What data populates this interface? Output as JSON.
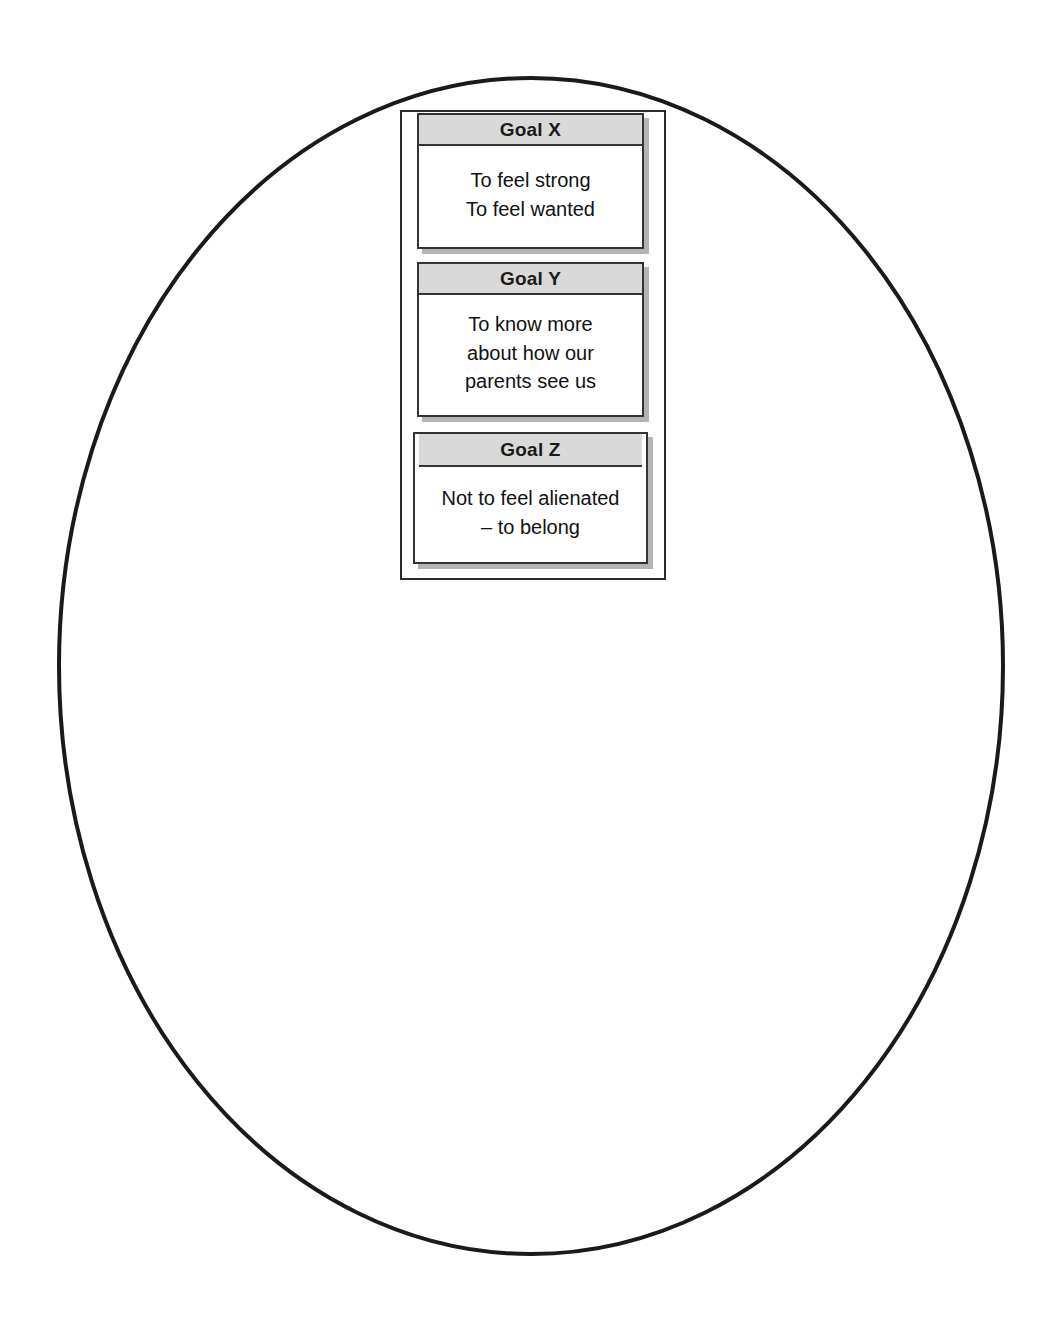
{
  "diagram": {
    "title_shape": "ellipse",
    "colors": {
      "ellipse_stroke": "#1a1a1a",
      "frame_stroke": "#2b2b2b",
      "card_stroke": "#333333",
      "card_header_fill": "#d9d9d9",
      "card_body_fill": "#ffffff",
      "shadow": "#b4b4b4",
      "text": "#111111",
      "background": "#ffffff"
    },
    "ellipse": {
      "cx": 531,
      "cy": 666,
      "rx": 472,
      "ry": 588,
      "stroke_width": 4
    },
    "cards": [
      {
        "header": "Goal X",
        "body": "To feel strong\nTo feel wanted"
      },
      {
        "header": "Goal Y",
        "body": "To know more\nabout how our\nparents see us"
      },
      {
        "header": "Goal Z",
        "body": "Not to feel alienated\n– to belong"
      }
    ]
  }
}
